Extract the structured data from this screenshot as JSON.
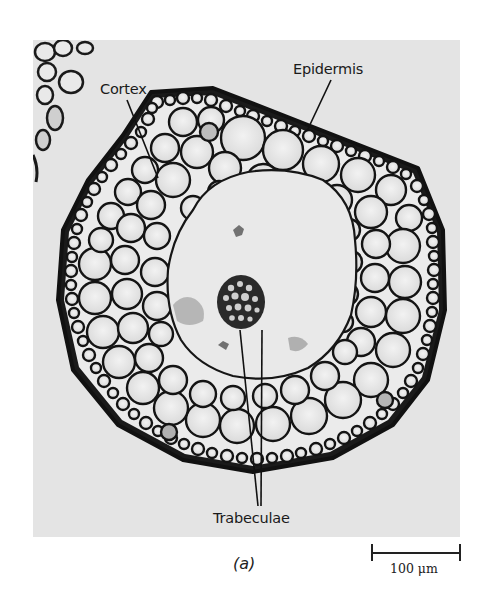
{
  "figure": {
    "panel_label": "(a)",
    "labels": {
      "epidermis": "Epidermis",
      "cortex": "Cortex",
      "trabeculae": "Trabeculae"
    },
    "scale_bar": {
      "label": "100 μm",
      "value": 100,
      "unit": "μm"
    },
    "colors": {
      "background": "#ffffff",
      "photo_background": "#e4e4e4",
      "cell_wall": "#111111",
      "cell_fill": "#ececec",
      "label_text": "#1a1a1a"
    }
  }
}
